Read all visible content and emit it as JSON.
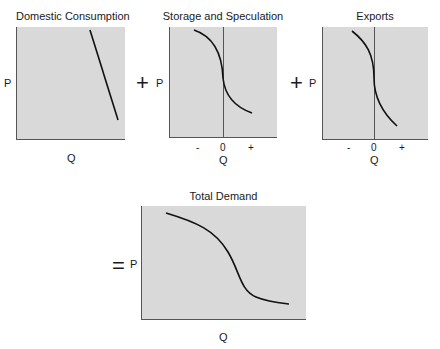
{
  "operators": {
    "plus1": "+",
    "plus2": "+",
    "equals": "="
  },
  "panels": [
    {
      "title": "Domestic Consumption",
      "y_label": "P",
      "x_label": "Q",
      "ticks": []
    },
    {
      "title": "Storage and Speculation",
      "y_label": "P",
      "x_label": "Q",
      "ticks": [
        "-",
        "0",
        "+"
      ]
    },
    {
      "title": "Exports",
      "y_label": "P",
      "x_label": "Q",
      "ticks": [
        "-",
        "0",
        "+"
      ]
    },
    {
      "title": "Total Demand",
      "y_label": "P",
      "x_label": "Q",
      "ticks": []
    }
  ],
  "colors": {
    "panel_fill": "#d9d9d9",
    "axis": "#555555",
    "curve": "#111111"
  }
}
